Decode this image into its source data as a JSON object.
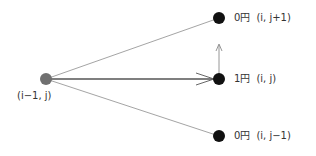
{
  "diagram": {
    "source_node": {
      "label": "(i−1, j)",
      "color": "#707070"
    },
    "target_nodes": [
      {
        "value": "0円",
        "coord": "(i, j+1)",
        "color": "#111111"
      },
      {
        "value": "1円",
        "coord": "(i, j)",
        "color": "#111111"
      },
      {
        "value": "0円",
        "coord": "(i, j−1)",
        "color": "#111111"
      }
    ],
    "edge_color": "#8a8a8a",
    "main_edge_color": "#555555"
  }
}
